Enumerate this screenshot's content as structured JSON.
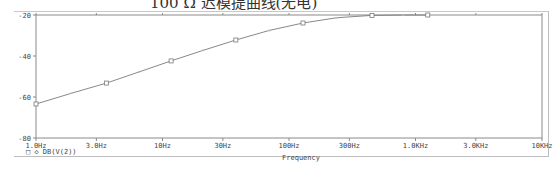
{
  "caption": "100 Ω 迟模提曲线(无电)",
  "chart_data": {
    "type": "line",
    "title": "",
    "xlabel": "Frequency",
    "ylabel": "",
    "xscale": "log",
    "xlim": [
      1,
      10000
    ],
    "ylim": [
      -80,
      -20
    ],
    "grid": false,
    "legend_position": "bottom-left",
    "x_tick_labels": [
      "1.0Hz",
      "3.0Hz",
      "10Hz",
      "30Hz",
      "100Hz",
      "300Hz",
      "1.0KHz",
      "3.0KHz",
      "10KHz"
    ],
    "x_ticks": [
      1,
      3,
      10,
      30,
      100,
      300,
      1000,
      3000,
      10000
    ],
    "y_tick_labels": [
      "-20",
      "-40",
      "-60",
      "-80"
    ],
    "y_ticks": [
      -20,
      -40,
      -60,
      -80
    ],
    "series": [
      {
        "name": "DB(V(2))",
        "marker": "square",
        "color": "#7a7a7a",
        "x": [
          1.0,
          1.9,
          3.6,
          6.5,
          11.7,
          21,
          38,
          70,
          129,
          240,
          453,
          800,
          1250
        ],
        "y": [
          -63.4,
          -58.2,
          -53.2,
          -47.8,
          -42.4,
          -37.2,
          -32.2,
          -27.5,
          -23.9,
          -21.3,
          -20.2,
          -20.0,
          -20.0
        ]
      }
    ],
    "legend": [
      "□ ◇ DB(V(2))"
    ]
  }
}
